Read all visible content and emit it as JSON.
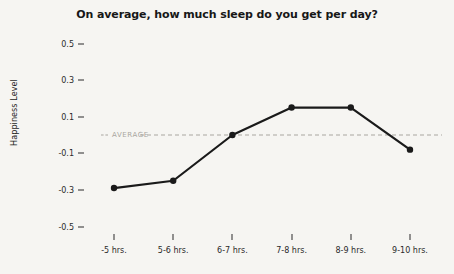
{
  "chart_data": {
    "type": "line",
    "title": "On average, how much sleep do you get per day?",
    "xlabel": "",
    "ylabel": "Happiness Level",
    "categories": [
      "-5 hrs.",
      "5-6 hrs.",
      "6-7 hrs.",
      "7-8 hrs.",
      "8-9 hrs.",
      "9-10 hrs."
    ],
    "values": [
      -0.29,
      -0.25,
      0.0,
      0.15,
      0.15,
      -0.08
    ],
    "ylim": [
      -0.6,
      0.6
    ],
    "yticks": [
      0.5,
      0.3,
      0.1,
      -0.1,
      -0.3,
      -0.5
    ],
    "ytick_labels": [
      "0.5",
      "0.3",
      "0.1",
      "-0.1",
      "-0.3",
      "-0.5"
    ],
    "grid": false,
    "legend": "none",
    "series": [
      {
        "name": "Happiness Level",
        "values": [
          -0.29,
          -0.25,
          0.0,
          0.15,
          0.15,
          -0.08
        ],
        "color": "#1a1a1a",
        "marker": "circle"
      }
    ],
    "reference_line": {
      "label": "AVERAGE",
      "value": 0.0,
      "style": "dashed",
      "color": "#a9a6a0"
    },
    "background_color": "#f6f5f2",
    "line_color": "#1a1a1a"
  }
}
